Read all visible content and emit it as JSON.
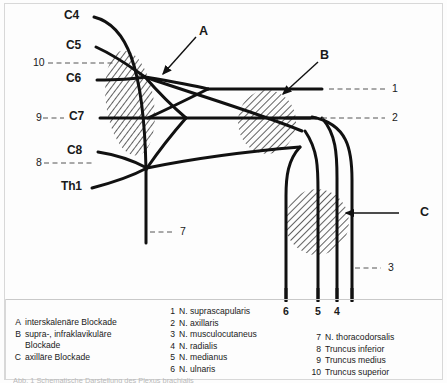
{
  "diagram": {
    "spinal_roots": [
      {
        "id": "C4",
        "label": "C4"
      },
      {
        "id": "C5",
        "label": "C5"
      },
      {
        "id": "C6",
        "label": "C6"
      },
      {
        "id": "C7",
        "label": "C7"
      },
      {
        "id": "C8",
        "label": "C8"
      },
      {
        "id": "Th1",
        "label": "Th1"
      }
    ],
    "trunk_markers": [
      {
        "id": "10",
        "label": "10"
      },
      {
        "id": "9",
        "label": "9"
      },
      {
        "id": "8",
        "label": "8"
      }
    ],
    "block_markers": [
      {
        "id": "A",
        "label": "A"
      },
      {
        "id": "B",
        "label": "B"
      },
      {
        "id": "C",
        "label": "C"
      }
    ],
    "nerve_markers_right": [
      {
        "id": "1",
        "label": "1"
      },
      {
        "id": "2",
        "label": "2"
      },
      {
        "id": "3",
        "label": "3"
      }
    ],
    "nerve_markers_bottom": [
      {
        "id": "6",
        "label": "6"
      },
      {
        "id": "5",
        "label": "5"
      },
      {
        "id": "4",
        "label": "4"
      }
    ],
    "nerve_marker_inner": {
      "id": "7",
      "label": "7"
    },
    "colors": {
      "line": "#111111",
      "hatch": "#1a1a1a",
      "leader": "#555555",
      "frame": "#d8d8d8"
    }
  },
  "legend": {
    "blockades": [
      {
        "key": "A",
        "text": "interskalenäre Blockade"
      },
      {
        "key": "B",
        "text": "supra-, infraklavikuläre",
        "cont": "Blockade"
      },
      {
        "key": "C",
        "text": "axilläre Blockade"
      }
    ],
    "nerves_left": [
      {
        "key": "1",
        "text": "N. suprascapularis"
      },
      {
        "key": "2",
        "text": "N. axillaris"
      },
      {
        "key": "3",
        "text": "N. musculocutaneus"
      },
      {
        "key": "4",
        "text": "N. radialis"
      },
      {
        "key": "5",
        "text": "N. medianus"
      },
      {
        "key": "6",
        "text": "N. ulnaris"
      }
    ],
    "nerves_right": [
      {
        "key": "7",
        "text": "N. thoracodorsalis"
      },
      {
        "key": "8",
        "text": "Truncus inferior"
      },
      {
        "key": "9",
        "text": "Truncus medius"
      },
      {
        "key": "10",
        "text": "Truncus superior"
      }
    ]
  },
  "footnote": {
    "text": "Abb. 1  Schematische Darstellung des Plexus brachialis"
  }
}
